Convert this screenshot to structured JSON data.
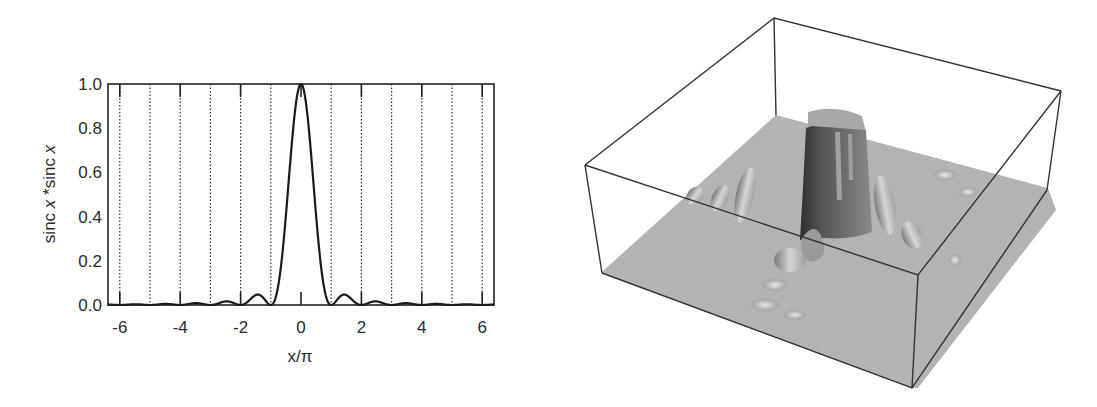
{
  "chart_data": [
    {
      "type": "line",
      "title": "",
      "xlabel": "x/π",
      "ylabel": "sinc x *sinc x",
      "ylabel_parts": [
        "sinc ",
        "x",
        " *sinc ",
        "x"
      ],
      "xlim": [
        -6.4,
        6.4
      ],
      "ylim": [
        0.0,
        1.0
      ],
      "xticks": [
        -6,
        -4,
        -2,
        0,
        2,
        4,
        6
      ],
      "xtick_labels": [
        "-6",
        "-4",
        "-2",
        "0",
        "2",
        "4",
        "6"
      ],
      "yticks": [
        0.0,
        0.2,
        0.4,
        0.6,
        0.8,
        1.0
      ],
      "ytick_labels": [
        "0.0",
        "0.2",
        "0.4",
        "0.6",
        "0.8",
        "1.0"
      ],
      "grid": {
        "vertical_dotted_at": [
          -6,
          -5,
          -4,
          -3,
          -2,
          -1,
          1,
          2,
          3,
          4,
          5,
          6
        ],
        "horizontal": false
      },
      "legend": null,
      "series": [
        {
          "name": "sinc²(x)",
          "function": "(sin(pi*u)/(pi*u))^2, u = x/π",
          "x": [
            -6,
            -5.5,
            -5,
            -4.5,
            -4,
            -3.5,
            -3,
            -2.5,
            -2,
            -1.5,
            -1.43,
            -1,
            -0.75,
            -0.5,
            -0.25,
            0,
            0.25,
            0.5,
            0.75,
            1,
            1.43,
            1.5,
            2,
            2.5,
            3,
            3.5,
            4,
            4.5,
            5,
            5.5,
            6
          ],
          "values": [
            0.0,
            0.0033,
            0.0,
            0.005,
            0.0,
            0.0083,
            0.0,
            0.016,
            0.0,
            0.045,
            0.047,
            0.0,
            0.09,
            0.405,
            0.811,
            1.0,
            0.811,
            0.405,
            0.09,
            0.0,
            0.047,
            0.045,
            0.0,
            0.016,
            0.0,
            0.0083,
            0.0,
            0.005,
            0.0,
            0.0033,
            0.0
          ]
        }
      ]
    },
    {
      "type": "surface3d",
      "title": "",
      "xlabel": "",
      "ylabel": "",
      "zlabel": "",
      "description": "3D shaded surface of sinc x * sinc y inside a wireframe box; tall central peak with smaller side lobes along both axes",
      "peak_value": 1.0,
      "colors": {
        "floor": "#b9b9b9",
        "peak_dark": "#555555",
        "peak_light": "#a8a8a8",
        "box_edge": "#333333"
      }
    }
  ]
}
